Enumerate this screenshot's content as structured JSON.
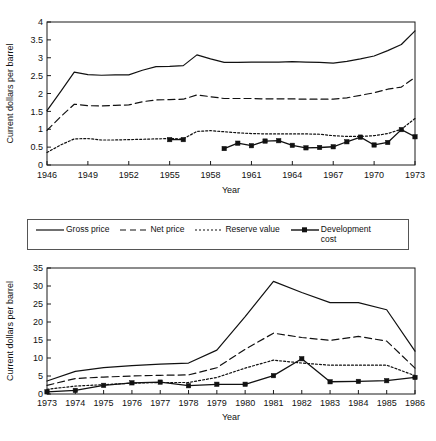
{
  "legend": {
    "items": [
      {
        "label": "Gross price",
        "style": "solid",
        "marker": false
      },
      {
        "label": "Net price",
        "style": "dashed",
        "marker": false
      },
      {
        "label": "Reserve value",
        "style": "dotted",
        "marker": false
      },
      {
        "label": "Development\ncost",
        "style": "solid",
        "marker": true
      }
    ]
  },
  "chart_data": [
    {
      "id": "top",
      "type": "line",
      "title": "",
      "xlabel": "Year",
      "ylabel": "Current dollars per barrel",
      "xlim": [
        1946,
        1973
      ],
      "ylim": [
        0,
        4
      ],
      "yticks": [
        0,
        0.5,
        1,
        1.5,
        2,
        2.5,
        3,
        3.5,
        4
      ],
      "ytick_labels": [
        "0",
        "0.5",
        "1",
        "1.5",
        "2",
        "2.5",
        "3",
        "3.5",
        "4"
      ],
      "xticks": [
        1946,
        1949,
        1952,
        1955,
        1958,
        1961,
        1964,
        1967,
        1970,
        1973
      ],
      "xtick_labels": [
        "1946",
        "1949",
        "1952",
        "1955",
        "1958",
        "1961",
        "1964",
        "1967",
        "1970",
        "1973"
      ],
      "grid": false,
      "series": [
        {
          "name": "Gross price",
          "style": "solid",
          "marker": false,
          "x": [
            1946,
            1947,
            1948,
            1949,
            1950,
            1951,
            1952,
            1953,
            1954,
            1955,
            1956,
            1957,
            1958,
            1959,
            1960,
            1961,
            1962,
            1963,
            1964,
            1965,
            1966,
            1967,
            1968,
            1969,
            1970,
            1971,
            1972,
            1973
          ],
          "values": [
            1.52,
            2.05,
            2.6,
            2.53,
            2.51,
            2.52,
            2.52,
            2.65,
            2.75,
            2.76,
            2.78,
            3.08,
            2.97,
            2.87,
            2.87,
            2.88,
            2.88,
            2.88,
            2.89,
            2.88,
            2.87,
            2.85,
            2.9,
            2.97,
            3.05,
            3.2,
            3.37,
            3.75
          ],
          "marker_x": []
        },
        {
          "name": "Net price",
          "style": "dashed",
          "marker": false,
          "x": [
            1946,
            1947,
            1948,
            1949,
            1950,
            1951,
            1952,
            1953,
            1954,
            1955,
            1956,
            1957,
            1958,
            1959,
            1960,
            1961,
            1962,
            1963,
            1964,
            1965,
            1966,
            1967,
            1968,
            1969,
            1970,
            1971,
            1972,
            1973
          ],
          "values": [
            0.97,
            1.35,
            1.7,
            1.66,
            1.65,
            1.67,
            1.68,
            1.77,
            1.82,
            1.83,
            1.84,
            1.96,
            1.91,
            1.86,
            1.86,
            1.86,
            1.85,
            1.85,
            1.85,
            1.84,
            1.84,
            1.84,
            1.88,
            1.95,
            2.02,
            2.12,
            2.18,
            2.45
          ],
          "marker_x": []
        },
        {
          "name": "Reserve value",
          "style": "dotted",
          "marker": false,
          "x": [
            1946,
            1947,
            1948,
            1949,
            1950,
            1951,
            1952,
            1953,
            1954,
            1955,
            1956,
            1957,
            1958,
            1959,
            1960,
            1961,
            1962,
            1963,
            1964,
            1965,
            1966,
            1967,
            1968,
            1969,
            1970,
            1971,
            1972,
            1973
          ],
          "values": [
            0.35,
            0.56,
            0.73,
            0.74,
            0.7,
            0.7,
            0.71,
            0.72,
            0.73,
            0.74,
            0.73,
            0.94,
            0.96,
            0.93,
            0.9,
            0.88,
            0.87,
            0.87,
            0.87,
            0.87,
            0.86,
            0.82,
            0.8,
            0.8,
            0.82,
            0.88,
            1.0,
            1.3
          ],
          "marker_x": []
        },
        {
          "name": "Development cost",
          "style": "solid",
          "marker": true,
          "segments": [
            {
              "x": [
                1955,
                1956
              ],
              "values": [
                0.71,
                0.71
              ]
            },
            {
              "x": [
                1959,
                1960,
                1961,
                1962,
                1963,
                1964,
                1965,
                1966,
                1967,
                1968,
                1969,
                1970,
                1971,
                1972,
                1973
              ],
              "values": [
                0.46,
                0.61,
                0.54,
                0.67,
                0.68,
                0.55,
                0.48,
                0.49,
                0.51,
                0.65,
                0.78,
                0.56,
                0.63,
                0.99,
                0.79
              ]
            }
          ]
        }
      ]
    },
    {
      "id": "bottom",
      "type": "line",
      "title": "",
      "xlabel": "Year",
      "ylabel": "Current dollars per barrel",
      "xlim": [
        1973,
        1986
      ],
      "ylim": [
        0,
        35
      ],
      "yticks": [
        0,
        5,
        10,
        15,
        20,
        25,
        30,
        35
      ],
      "ytick_labels": [
        "0",
        "5",
        "10",
        "15",
        "20",
        "25",
        "30",
        "35"
      ],
      "xticks": [
        1973,
        1974,
        1975,
        1976,
        1977,
        1978,
        1979,
        1980,
        1981,
        1982,
        1983,
        1984,
        1985,
        1986
      ],
      "xtick_labels": [
        "1973",
        "1974",
        "1975",
        "1976",
        "1977",
        "1978",
        "1979",
        "1980",
        "1981",
        "1982",
        "1983",
        "1984",
        "1985",
        "1986"
      ],
      "grid": false,
      "series": [
        {
          "name": "Gross price",
          "style": "solid",
          "marker": false,
          "x": [
            1973,
            1974,
            1975,
            1976,
            1977,
            1978,
            1979,
            1980,
            1981,
            1982,
            1983,
            1984,
            1985,
            1986
          ],
          "values": [
            3.6,
            6.3,
            7.3,
            7.9,
            8.3,
            8.6,
            12.2,
            21.5,
            31.3,
            28.2,
            25.4,
            25.4,
            23.4,
            11.9
          ],
          "marker_x": []
        },
        {
          "name": "Net price",
          "style": "dashed",
          "marker": false,
          "x": [
            1973,
            1974,
            1975,
            1976,
            1977,
            1978,
            1979,
            1980,
            1981,
            1982,
            1983,
            1984,
            1985,
            1986
          ],
          "values": [
            2.4,
            4.3,
            4.7,
            5.0,
            5.2,
            5.3,
            7.3,
            12.4,
            16.9,
            15.7,
            14.9,
            16.0,
            14.7,
            7.2
          ],
          "marker_x": []
        },
        {
          "name": "Reserve value",
          "style": "dotted",
          "marker": false,
          "x": [
            1973,
            1974,
            1975,
            1976,
            1977,
            1978,
            1979,
            1980,
            1981,
            1982,
            1983,
            1984,
            1985,
            1986
          ],
          "values": [
            1.3,
            2.2,
            2.6,
            3.0,
            3.2,
            3.2,
            4.6,
            7.2,
            9.4,
            8.6,
            8.0,
            8.0,
            8.0,
            5.1
          ],
          "marker_x": []
        },
        {
          "name": "Development cost",
          "style": "solid",
          "marker": true,
          "segments": [
            {
              "x": [
                1973,
                1974,
                1975,
                1976,
                1977,
                1978,
                1979,
                1980,
                1981,
                1982,
                1983,
                1984,
                1985,
                1986
              ],
              "values": [
                0.6,
                1.0,
                2.4,
                3.1,
                3.3,
                2.3,
                2.7,
                2.7,
                5.1,
                9.8,
                3.4,
                3.5,
                3.7,
                4.6
              ]
            }
          ]
        }
      ]
    }
  ]
}
